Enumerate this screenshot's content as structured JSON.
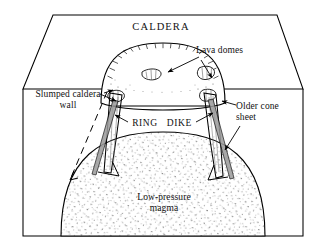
{
  "figure": {
    "type": "geological-cross-section-block-diagram",
    "background_color": "#ffffff",
    "line_color": "#000000",
    "stipple_color": "#555555"
  },
  "labels": {
    "caldera": "CALDERA",
    "lava_domes": "Lava domes",
    "slumped_caldera_wall": "Slumped caldera\nwall",
    "older_cone_sheet": "Older cone\nsheet",
    "ring_dike": "RING   DIKE",
    "low_pressure_magma": "Low-pressure\nmagma"
  },
  "features": [
    {
      "name": "caldera-top-surface",
      "kind": "block-top-face",
      "description": "Trapezoidal upper surface of the block diagram"
    },
    {
      "name": "resurgent-dome",
      "kind": "domed-uplift",
      "description": "Arched dome with radial tick hachures on the caldera floor"
    },
    {
      "name": "lava-dome-left",
      "kind": "lava-dome",
      "description": "Small elongate extrusive dome on the uplift"
    },
    {
      "name": "lava-dome-right",
      "kind": "lava-dome",
      "description": "Small elongate extrusive dome on the uplift"
    },
    {
      "name": "ring-dike-left",
      "kind": "ring-dike",
      "description": "Tapered outward-dipping intrusive conduit on the left"
    },
    {
      "name": "ring-dike-right",
      "kind": "ring-dike",
      "description": "Tapered outward-dipping intrusive conduit on the right"
    },
    {
      "name": "older-cone-sheet",
      "kind": "cone-sheet",
      "description": "Older inward-dipping sheet intrusion"
    },
    {
      "name": "slumped-wall-trace",
      "kind": "dashed-fault-trace",
      "description": "Dashed line marking the slumped caldera wall"
    },
    {
      "name": "magma-chamber",
      "kind": "stippled-magma-body",
      "description": "Large domed low-pressure magma reservoir shown with stipple ornament"
    },
    {
      "name": "caldera-floor-line",
      "kind": "horizontal-surface-line",
      "description": "Flat caldera floor between the two ring dikes"
    }
  ]
}
